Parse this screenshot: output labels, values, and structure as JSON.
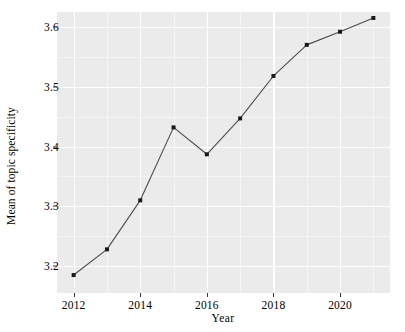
{
  "chart_data": {
    "type": "line",
    "title": "",
    "xlabel": "Year",
    "ylabel": "Mean of topic specificity",
    "x": [
      2012,
      2013,
      2014,
      2015,
      2016,
      2017,
      2018,
      2019,
      2020,
      2021
    ],
    "values": [
      3.185,
      3.228,
      3.31,
      3.432,
      3.387,
      3.447,
      3.518,
      3.57,
      3.592,
      3.615
    ],
    "series": [
      {
        "name": "Mean of topic specificity",
        "values": [
          3.185,
          3.228,
          3.31,
          3.432,
          3.387,
          3.447,
          3.518,
          3.57,
          3.592,
          3.615
        ]
      }
    ],
    "xlim": [
      2011.5,
      2021.5
    ],
    "ylim": [
      3.155,
      3.625
    ],
    "x_ticks": [
      2012,
      2014,
      2016,
      2018,
      2020
    ],
    "x_tick_labels": [
      "2012",
      "2014",
      "2016",
      "2018",
      "2020"
    ],
    "x_minor_ticks": [
      2013,
      2015,
      2017,
      2019,
      2021
    ],
    "y_ticks": [
      3.2,
      3.3,
      3.4,
      3.5,
      3.6
    ],
    "y_tick_labels": [
      "3.2",
      "3.3",
      "3.4",
      "3.5",
      "3.6"
    ],
    "y_minor_ticks": [
      3.25,
      3.35,
      3.45,
      3.55
    ],
    "grid": true,
    "legend": false,
    "legend_position": "none",
    "markers": "filled-square",
    "panel_background": "#ebebeb",
    "grid_color": "#ffffff",
    "line_color": "#4d4d4d",
    "marker_color": "#1a1a1a",
    "annotations": []
  },
  "axes": {
    "x_title": "Year",
    "y_title": "Mean of topic specificity"
  }
}
